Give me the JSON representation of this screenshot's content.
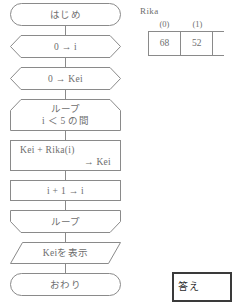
{
  "flowchart": {
    "nodes": [
      {
        "id": "start",
        "shape": "terminator",
        "text": "はじめ"
      },
      {
        "id": "init-i",
        "shape": "preparation",
        "text": "0 → i"
      },
      {
        "id": "init-kei",
        "shape": "preparation",
        "text": "0 → Kei"
      },
      {
        "id": "loop-start",
        "shape": "loop-start",
        "text": "ループ",
        "text2": "i ＜ 5 の間"
      },
      {
        "id": "accumulate",
        "shape": "process",
        "text": "Kei + Rika(i)",
        "text2": "→ Kei"
      },
      {
        "id": "increment",
        "shape": "process",
        "text": "i + 1 → i"
      },
      {
        "id": "loop-end",
        "shape": "loop-end",
        "text": "ループ"
      },
      {
        "id": "display",
        "shape": "io",
        "text": "Keiを表示"
      },
      {
        "id": "end",
        "shape": "terminator",
        "text": "おわり"
      }
    ]
  },
  "rika_table": {
    "array_name": "Rika",
    "indices": [
      "(0)",
      "(1)"
    ],
    "values": [
      "68",
      "52"
    ]
  },
  "answer_box": {
    "label": "答え"
  },
  "colors": {
    "stroke": "#8a8a8a",
    "text": "#6e6e6e",
    "answer_border": "#3a3a3a"
  }
}
